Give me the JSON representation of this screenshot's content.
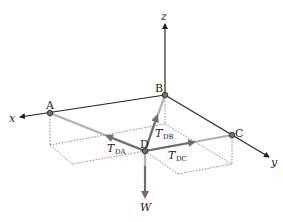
{
  "figure": {
    "type": "3D statics free-body diagram",
    "axes": {
      "x": {
        "label": "x"
      },
      "y": {
        "label": "y"
      },
      "z": {
        "label": "z"
      }
    },
    "points": {
      "A": {
        "label": "A"
      },
      "B": {
        "label": "B"
      },
      "C": {
        "label": "C"
      },
      "D": {
        "label": "D"
      }
    },
    "forces": {
      "T_DA": {
        "main": "T",
        "sub": "DA"
      },
      "T_DB": {
        "main": "T",
        "sub": "DB"
      },
      "T_DC": {
        "main": "T",
        "sub": "DC"
      },
      "W": {
        "main": "W"
      }
    },
    "colors": {
      "axis": "#222222",
      "cable": "#b0b0b0",
      "force_arrow": "#6e6e6e",
      "point_fill": "#707070",
      "dotted": "#555555"
    }
  }
}
